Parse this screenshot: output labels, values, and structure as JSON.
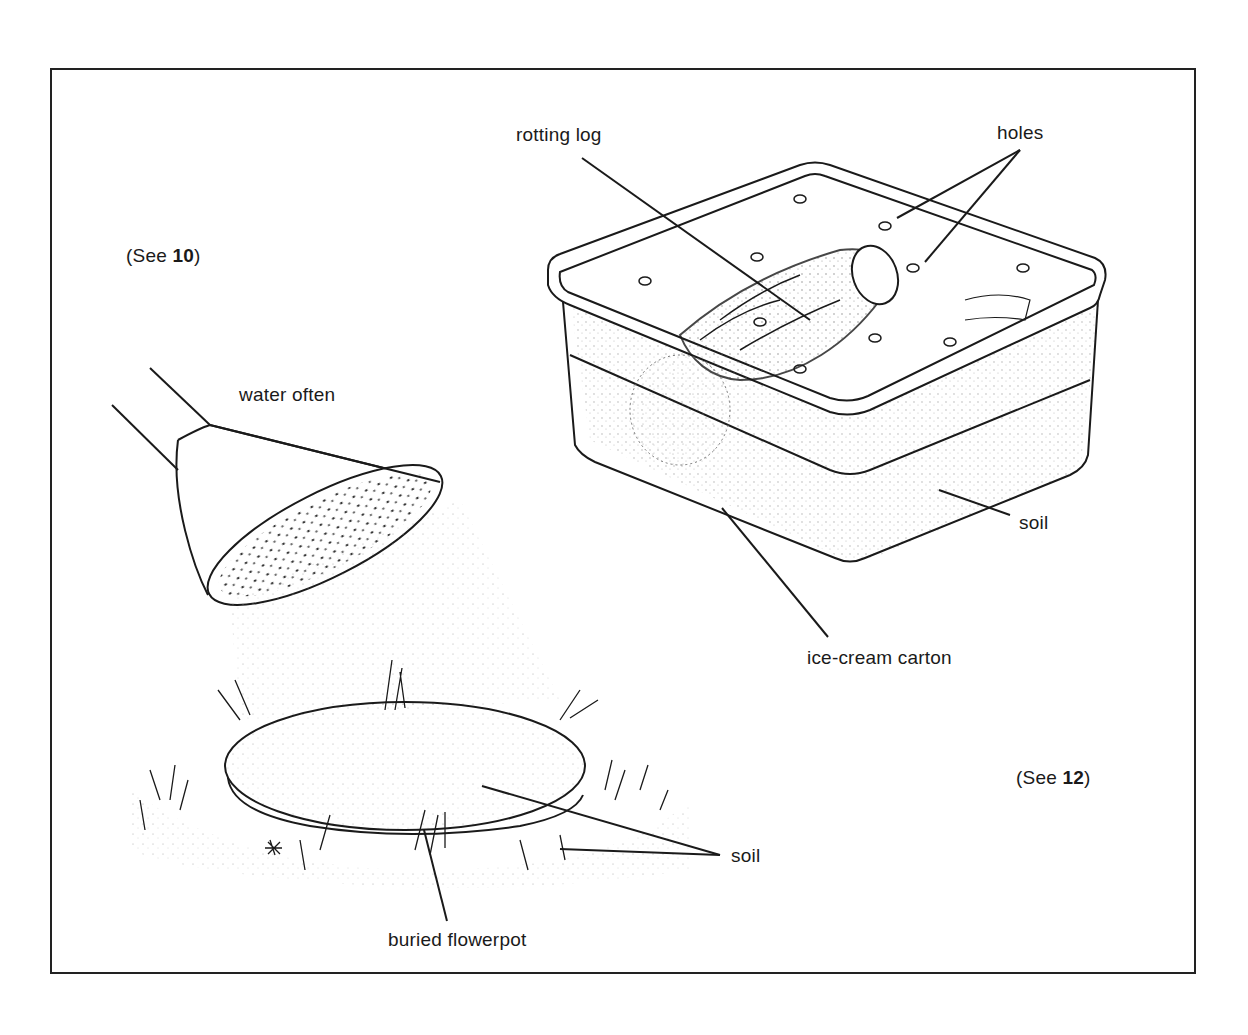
{
  "figure": {
    "references": {
      "left": {
        "prefix": "(See ",
        "number": "10",
        "suffix": ")"
      },
      "right": {
        "prefix": "(See ",
        "number": "12",
        "suffix": ")"
      }
    },
    "labels": {
      "rotting_log": "rotting log",
      "holes": "holes",
      "water_often": "water often",
      "soil_carton": "soil",
      "ice_cream_carton": "ice-cream carton",
      "soil_pot": "soil",
      "buried_flowerpot": "buried flowerpot"
    },
    "colors": {
      "ink": "#1a1a1a",
      "paper": "#ffffff",
      "stipple": "#555555"
    }
  }
}
